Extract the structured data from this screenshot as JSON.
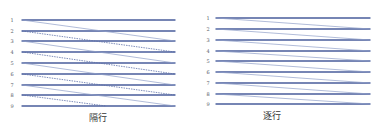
{
  "diagrams": [
    {
      "id": "interlaced",
      "caption": "隔行",
      "rows": [
        "1",
        "2",
        "3",
        "4",
        "5",
        "6",
        "7",
        "8",
        "9"
      ],
      "label_x": 12,
      "line_x1": 22,
      "line_x2": 175,
      "row_y": [
        20,
        31,
        41,
        52,
        63,
        74,
        85,
        95,
        106
      ],
      "caption_x": 98,
      "caption_y": 121
    },
    {
      "id": "progressive",
      "caption": "逐行",
      "rows": [
        "1",
        "2",
        "3",
        "4",
        "5",
        "6",
        "7",
        "8",
        "9"
      ],
      "label_x": 208,
      "line_x1": 216,
      "line_x2": 370,
      "row_y": [
        18,
        29,
        40,
        51,
        61,
        72,
        83,
        94,
        104
      ],
      "caption_x": 272,
      "caption_y": 119
    }
  ],
  "colors": {
    "scan_line": "#4a5e9c",
    "retrace_line": "#8f9fc8",
    "retrace_dashed": "#5d70a8",
    "label": "#555a66",
    "caption": "#333333",
    "background": "#ffffff"
  }
}
